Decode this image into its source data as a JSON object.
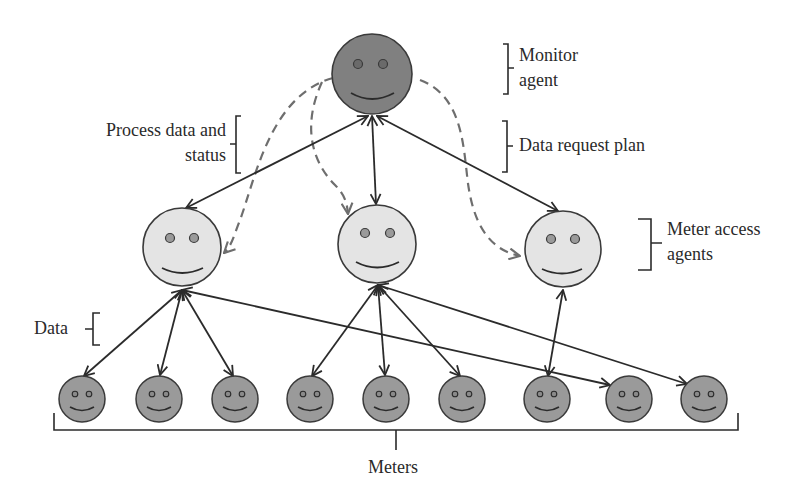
{
  "labels": {
    "monitor": [
      "Monitor",
      "agent"
    ],
    "data_request_plan": "Data request plan",
    "process_data": [
      "Process data and",
      "status"
    ],
    "meter_access": [
      "Meter access",
      "agents"
    ],
    "data": "Data",
    "meters": "Meters"
  },
  "colors": {
    "monitor_fill": "#808080",
    "access_fill": "#e4e4e4",
    "meter_fill": "#9a9a9a",
    "stroke": "#2b2b2b",
    "dashed": "#6e6e6e"
  },
  "nodes": {
    "monitor": {
      "x": 372,
      "y": 74,
      "r": 40
    },
    "access": [
      {
        "x": 182,
        "y": 247,
        "r": 39
      },
      {
        "x": 377,
        "y": 244,
        "r": 39
      },
      {
        "x": 563,
        "y": 249,
        "r": 38
      }
    ],
    "meters": [
      {
        "x": 82,
        "y": 399
      },
      {
        "x": 159,
        "y": 399
      },
      {
        "x": 235,
        "y": 399
      },
      {
        "x": 310,
        "y": 399
      },
      {
        "x": 386,
        "y": 399
      },
      {
        "x": 462,
        "y": 399
      },
      {
        "x": 547,
        "y": 399
      },
      {
        "x": 629,
        "y": 399
      },
      {
        "x": 704,
        "y": 399
      }
    ],
    "meter_r": 23
  }
}
